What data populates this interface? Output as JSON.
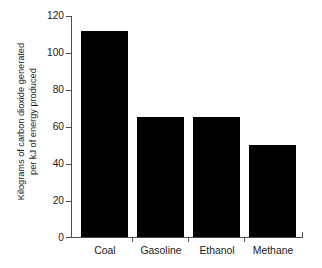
{
  "chart_data": {
    "type": "bar",
    "title": "",
    "xlabel": "",
    "ylabel_line1": "Kilograms of carbon dioxide generated",
    "ylabel_line2": "per kJ of energy produced",
    "categories": [
      "Coal",
      "Gasoline",
      "Ethanol",
      "Methane"
    ],
    "values": [
      112,
      65,
      65,
      50
    ],
    "ylim": [
      0,
      120
    ],
    "yticks": [
      0,
      20,
      40,
      60,
      80,
      100,
      120
    ],
    "ytick_labels": [
      "0",
      "20",
      "40",
      "60",
      "80",
      "100",
      "120"
    ],
    "grid": false,
    "legend": "none",
    "bar_color": "#000000",
    "axis_color": "#4d4d4d",
    "background_color": "#ffffff"
  }
}
